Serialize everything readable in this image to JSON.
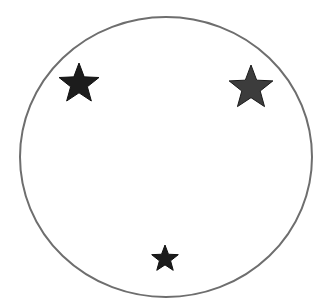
{
  "diagram": {
    "background": "#ffffff",
    "circle": {
      "cx": 166,
      "cy": 157,
      "rx": 146,
      "ry": 140,
      "stroke": "#6e6e6e",
      "stroke_width": 2
    },
    "stars": [
      {
        "name": "star-top-left",
        "cx": 79,
        "cy": 84,
        "r": 21,
        "fill": "#1c1c1c",
        "stroke": "#111111"
      },
      {
        "name": "star-top-right",
        "cx": 251,
        "cy": 88,
        "r": 23,
        "fill": "#3c3c3c",
        "stroke": "#1a1a1a"
      },
      {
        "name": "star-bottom",
        "cx": 165,
        "cy": 259,
        "r": 14,
        "fill": "#1c1c1c",
        "stroke": "#111111"
      }
    ]
  }
}
